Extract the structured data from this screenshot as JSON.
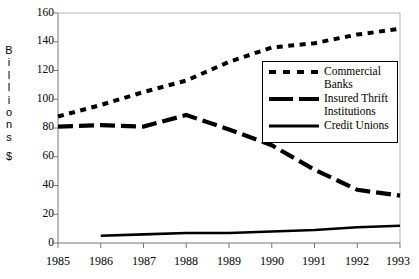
{
  "chart_data": {
    "type": "line",
    "title": "",
    "xlabel": "",
    "ylabel": "Billions $",
    "ylim": [
      0,
      160
    ],
    "yticks": [
      0,
      20,
      40,
      60,
      80,
      100,
      120,
      140,
      160
    ],
    "grid": false,
    "legend_position": "center-right-inside",
    "categories": [
      "1985",
      "1986",
      "1987",
      "1988",
      "1989",
      "1990",
      "1991",
      "1992",
      "1993"
    ],
    "x": [
      1985,
      1986,
      1987,
      1988,
      1989,
      1990,
      1991,
      1992,
      1993
    ],
    "series": [
      {
        "name": "Commercial Banks",
        "style": "dotted",
        "values": [
          88,
          96,
          105,
          113,
          126,
          136,
          139,
          145,
          149
        ]
      },
      {
        "name": "Insured Thrift Institutions",
        "style": "dashed",
        "values": [
          81,
          82,
          81,
          89,
          79,
          68,
          51,
          37,
          33
        ]
      },
      {
        "name": "Credit Unions",
        "style": "solid",
        "values": [
          null,
          5,
          6,
          7,
          7,
          8,
          9,
          11,
          12
        ]
      }
    ]
  },
  "axis": {
    "y_caption_letters": [
      "B",
      "i",
      "l",
      "l",
      "i",
      "o",
      "n",
      "s"
    ],
    "y_caption_currency": "$",
    "y_tick_labels": [
      "160",
      "140",
      "120",
      "100",
      "80",
      "60",
      "40",
      "20",
      "0"
    ],
    "x_tick_labels": [
      "1985",
      "1986",
      "1987",
      "1988",
      "1989",
      "1990",
      "1991",
      "1992",
      "1993"
    ]
  },
  "legend": {
    "entries": [
      {
        "label_line1": "Commercial",
        "label_line2": "Banks",
        "style": "dotted"
      },
      {
        "label_line1": "Insured Thrift",
        "label_line2": "Institutions",
        "style": "dashed"
      },
      {
        "label_line1": "Credit Unions",
        "label_line2": "",
        "style": "solid"
      }
    ]
  },
  "colors": {
    "line": "#000000",
    "frame": "#a8a8a8",
    "background": "#ffffff"
  }
}
